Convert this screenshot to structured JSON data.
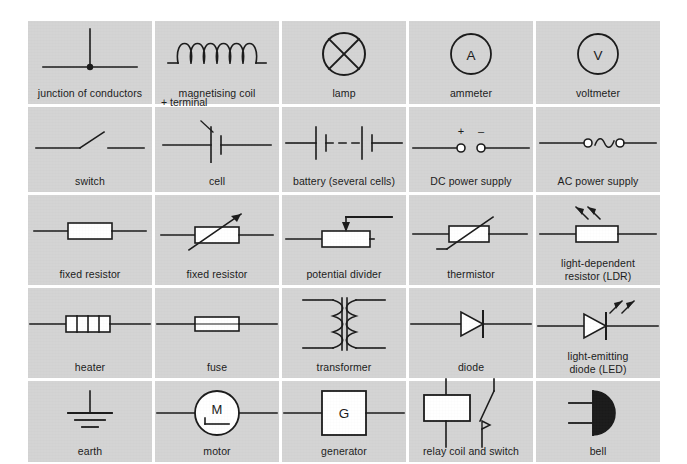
{
  "sheet": {
    "title": "Circuit symbols reference chart",
    "background_color": "#ffffff",
    "cell_color": "#d4d4d4",
    "ink_color": "#1a1a1a",
    "columns": 5,
    "rows": 5
  },
  "cells": [
    {
      "id": "junction-of-conductors",
      "label": "junction of conductors",
      "symbol": "junction",
      "annotation": ""
    },
    {
      "id": "magnetising-coil",
      "label": "magnetising coil",
      "symbol": "coil",
      "annotation": ""
    },
    {
      "id": "lamp",
      "label": "lamp",
      "symbol": "lamp",
      "annotation": ""
    },
    {
      "id": "ammeter",
      "label": "ammeter",
      "symbol": "meter",
      "meter_letter": "A",
      "annotation": ""
    },
    {
      "id": "voltmeter",
      "label": "voltmeter",
      "symbol": "meter",
      "meter_letter": "V",
      "annotation": ""
    },
    {
      "id": "switch",
      "label": "switch",
      "symbol": "switch",
      "annotation": ""
    },
    {
      "id": "cell",
      "label": "cell",
      "symbol": "cell",
      "annotation": "+ terminal"
    },
    {
      "id": "battery",
      "label": "battery (several cells)",
      "symbol": "battery",
      "annotation": ""
    },
    {
      "id": "dc-power-supply",
      "label": "DC power supply",
      "symbol": "dc-supply",
      "plus_sign": "+",
      "minus_sign": "–",
      "annotation": ""
    },
    {
      "id": "ac-power-supply",
      "label": "AC power supply",
      "symbol": "ac-supply",
      "annotation": ""
    },
    {
      "id": "fixed-resistor",
      "label": "fixed resistor",
      "symbol": "resistor",
      "annotation": ""
    },
    {
      "id": "variable-resistor",
      "label": "fixed resistor",
      "symbol": "variable-resistor",
      "annotation": ""
    },
    {
      "id": "potential-divider",
      "label": "potential divider",
      "symbol": "potential-divider",
      "annotation": ""
    },
    {
      "id": "thermistor",
      "label": "thermistor",
      "symbol": "thermistor",
      "annotation": ""
    },
    {
      "id": "ldr",
      "label": "light-dependent\nresistor (LDR)",
      "symbol": "ldr",
      "annotation": ""
    },
    {
      "id": "heater",
      "label": "heater",
      "symbol": "heater",
      "annotation": ""
    },
    {
      "id": "fuse",
      "label": "fuse",
      "symbol": "fuse",
      "annotation": ""
    },
    {
      "id": "transformer",
      "label": "transformer",
      "symbol": "transformer",
      "annotation": ""
    },
    {
      "id": "diode",
      "label": "diode",
      "symbol": "diode",
      "annotation": ""
    },
    {
      "id": "led",
      "label": "light-emitting\ndiode (LED)",
      "symbol": "led",
      "annotation": ""
    },
    {
      "id": "earth",
      "label": "earth",
      "symbol": "earth",
      "annotation": ""
    },
    {
      "id": "motor",
      "label": "motor",
      "symbol": "motor",
      "motor_letter": "M",
      "annotation": ""
    },
    {
      "id": "generator",
      "label": "generator",
      "symbol": "generator",
      "generator_letter": "G",
      "annotation": ""
    },
    {
      "id": "relay",
      "label": "relay coil and switch",
      "symbol": "relay",
      "annotation": ""
    },
    {
      "id": "bell",
      "label": "bell",
      "symbol": "bell",
      "annotation": ""
    }
  ]
}
